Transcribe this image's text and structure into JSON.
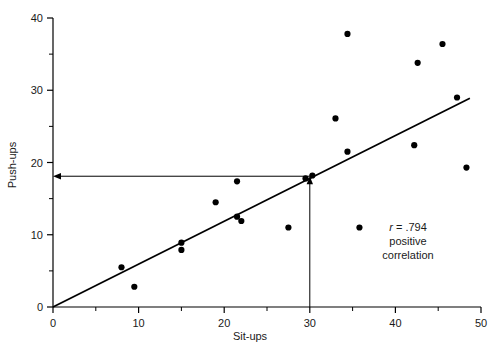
{
  "chart_data": {
    "type": "scatter",
    "title": "",
    "xlabel": "Sit-ups",
    "ylabel": "Push-ups",
    "xlim": [
      0,
      50
    ],
    "ylim": [
      0,
      40
    ],
    "x_major_ticks": [
      0,
      10,
      20,
      30,
      40,
      50
    ],
    "x_minor_ticks": [
      5,
      15,
      25,
      35,
      45
    ],
    "y_major_ticks": [
      0,
      10,
      20,
      30,
      40
    ],
    "y_minor_ticks": [
      5,
      15,
      25,
      35
    ],
    "grid": false,
    "legend": null,
    "points": [
      {
        "x": 8,
        "y": 5.5
      },
      {
        "x": 9.5,
        "y": 2.8
      },
      {
        "x": 15,
        "y": 8.9
      },
      {
        "x": 15,
        "y": 7.9
      },
      {
        "x": 19,
        "y": 14.5
      },
      {
        "x": 21.5,
        "y": 17.4
      },
      {
        "x": 21.5,
        "y": 12.5
      },
      {
        "x": 22,
        "y": 11.9
      },
      {
        "x": 27.5,
        "y": 11.0
      },
      {
        "x": 29.5,
        "y": 17.8
      },
      {
        "x": 30.3,
        "y": 18.2
      },
      {
        "x": 33,
        "y": 26.1
      },
      {
        "x": 34.4,
        "y": 37.8
      },
      {
        "x": 34.4,
        "y": 21.5
      },
      {
        "x": 35.8,
        "y": 11.0
      },
      {
        "x": 42.2,
        "y": 22.4
      },
      {
        "x": 42.6,
        "y": 33.8
      },
      {
        "x": 45.5,
        "y": 36.4
      },
      {
        "x": 47.2,
        "y": 29.0
      },
      {
        "x": 48.3,
        "y": 19.3
      }
    ],
    "trend_line": {
      "label": "regression-line",
      "x0": 0,
      "y0": 0,
      "x1": 48.7,
      "y1": 28.9
    },
    "reference_lines": [
      {
        "name": "vertical-reference-arrow",
        "x": 30,
        "from_y": 0,
        "to_y": 18.1,
        "arrow": "up"
      },
      {
        "name": "horizontal-reference-arrow",
        "y": 18.1,
        "from_x": 30,
        "to_x": 0,
        "arrow": "left"
      }
    ],
    "annotations": [
      {
        "name": "correlation-coefficient",
        "text_italic": "r",
        "text": " = .794"
      },
      {
        "name": "correlation-direction-line1",
        "text": "positive"
      },
      {
        "name": "correlation-direction-line2",
        "text": "correlation"
      }
    ],
    "colors": {
      "marker": "#000000",
      "axis": "#000000",
      "trend": "#000000",
      "reference": "#000000",
      "background": "#ffffff"
    }
  },
  "labels": {
    "x_axis_title": "Sit-ups",
    "y_axis_title": "Push-ups",
    "x_ticks": [
      "0",
      "10",
      "20",
      "30",
      "40",
      "50"
    ],
    "y_ticks": [
      "0",
      "10",
      "20",
      "30",
      "40"
    ],
    "annotation_r": "r",
    "annotation_r_value": " = .794",
    "annotation_line2": "positive",
    "annotation_line3": "correlation"
  }
}
